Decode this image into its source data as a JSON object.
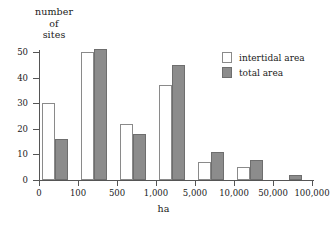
{
  "chart_data": {
    "type": "bar",
    "title": "",
    "xlabel": "ha",
    "ylabel": "number of sites",
    "ylabel_lines": [
      "number",
      "of",
      "sites"
    ],
    "categories": [
      "0-100",
      "100-500",
      "500-1,000",
      "1,000-5,000",
      "5,000-10,000",
      "10,000-50,000",
      "50,000-100,000"
    ],
    "xtick_labels": [
      "0",
      "100",
      "500",
      "1,000",
      "5,000",
      "10,000",
      "50,000",
      "100,000"
    ],
    "ytick_labels": [
      "0",
      "10",
      "20",
      "30",
      "40",
      "50"
    ],
    "ylim": [
      0,
      50
    ],
    "grid": false,
    "legend_position": "top-right",
    "series": [
      {
        "name": "intertidal area",
        "color": "#ffffff",
        "values": [
          30,
          50,
          22,
          37,
          7,
          5,
          0
        ]
      },
      {
        "name": "total area",
        "color": "#8c8c8c",
        "values": [
          16,
          51,
          18,
          45,
          11,
          8,
          2
        ]
      }
    ]
  },
  "legend": {
    "items": [
      {
        "label": "intertidal area"
      },
      {
        "label": "total area"
      }
    ]
  }
}
